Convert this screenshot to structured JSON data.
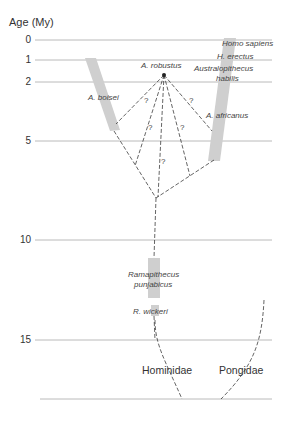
{
  "figure": {
    "axis_title": "Age (My)",
    "ticks": [
      {
        "label": "0",
        "value": 0
      },
      {
        "label": "1",
        "value": 1
      },
      {
        "label": "2",
        "value": 2
      },
      {
        "label": "5",
        "value": 5
      },
      {
        "label": "10",
        "value": 10
      },
      {
        "label": "15",
        "value": 15
      }
    ],
    "taxa": {
      "homo_sapiens": "Homo sapiens",
      "h_erectus": "H. erectus",
      "australopithecus_habilis_1": "Australopithecus",
      "australopithecus_habilis_2": "habilis",
      "a_robustus": "A. robustus",
      "a_boisei": "A. boisei",
      "a_africanus": "A. africanus",
      "ramapithecus_1": "Ramapithecus",
      "ramapithecus_2": "punjabicus",
      "r_wickeri": "R. wickeri"
    },
    "question_mark": "?",
    "families": {
      "hominidae": "Hominidae",
      "pongidae": "Pongidae"
    },
    "colors": {
      "line": "#9a9a9a",
      "bar": "#cfcfcf",
      "dash": "#222222"
    }
  }
}
